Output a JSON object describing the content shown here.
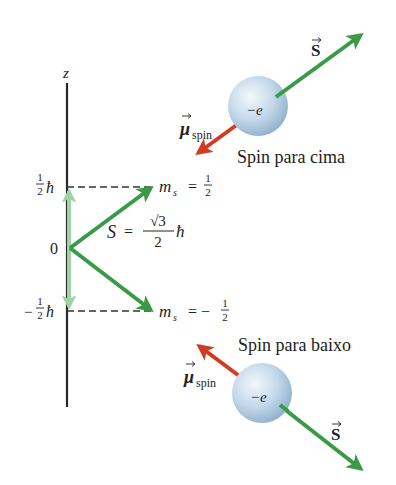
{
  "colors": {
    "axis": "#2a2a2a",
    "green": "#3a9a45",
    "light_green": "#9fd3a5",
    "red": "#d23a22",
    "sphere_light": "#eef4fa",
    "sphere_mid": "#bcd3e6",
    "sphere_dark": "#8fb0cc",
    "text": "#222222"
  },
  "axis": {
    "label": "z",
    "origin_label": "0",
    "upper_level_label": {
      "num": "1",
      "den": "2",
      "unit": "ħ"
    },
    "lower_level_label": {
      "sign": "−",
      "num": "1",
      "den": "2",
      "unit": "ħ"
    }
  },
  "states": {
    "up": {
      "ms_label": "m",
      "ms_sub": "s",
      "eq": "=",
      "value_num": "1",
      "value_den": "2"
    },
    "down": {
      "ms_label": "m",
      "ms_sub": "s",
      "eq": "= −",
      "value_num": "1",
      "value_den": "2"
    }
  },
  "spin_magnitude": {
    "symbol": "S",
    "eq": "=",
    "num": "√3",
    "den": "2",
    "unit": "ħ"
  },
  "electrons": {
    "up": {
      "charge": "−e",
      "caption": "Spin para cima",
      "s_label": "S",
      "mu_label": "μ",
      "mu_sub": "spin"
    },
    "down": {
      "charge": "−e",
      "caption": "Spin para baixo",
      "s_label": "S",
      "mu_label": "μ",
      "mu_sub": "spin"
    }
  }
}
